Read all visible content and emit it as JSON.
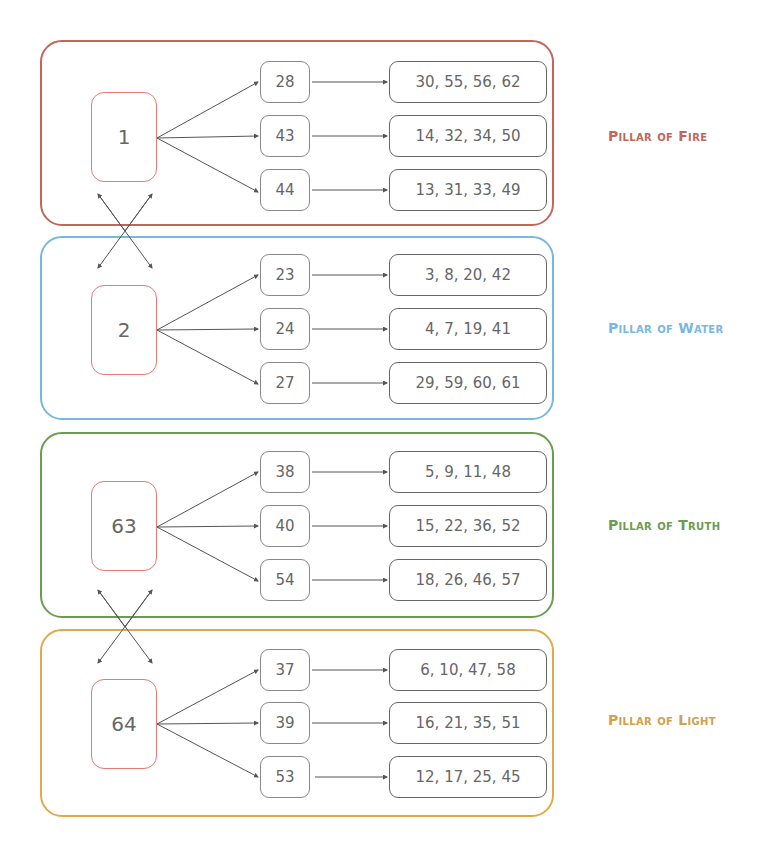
{
  "colors": {
    "fire": "#c0675a",
    "water": "#7ab7de",
    "truth": "#6a9d4f",
    "light": "#e2a94a",
    "root_border": "#e47a72",
    "edge": "#555555"
  },
  "pillars": [
    {
      "label": "Pillar of Fire",
      "root": "1",
      "children": [
        {
          "node": "28",
          "leaf": "30, 55, 56, 62"
        },
        {
          "node": "43",
          "leaf": "14, 32, 34, 50"
        },
        {
          "node": "44",
          "leaf": "13, 31, 33, 49"
        }
      ]
    },
    {
      "label": "Pillar of Water",
      "root": "2",
      "children": [
        {
          "node": "23",
          "leaf": "3, 8, 20, 42"
        },
        {
          "node": "24",
          "leaf": "4, 7, 19, 41"
        },
        {
          "node": "27",
          "leaf": "29, 59, 60, 61"
        }
      ]
    },
    {
      "label": "Pillar of Truth",
      "root": "63",
      "children": [
        {
          "node": "38",
          "leaf": "5, 9, 11, 48"
        },
        {
          "node": "40",
          "leaf": "15, 22, 36, 52"
        },
        {
          "node": "54",
          "leaf": "18, 26, 46, 57"
        }
      ]
    },
    {
      "label": "Pillar of Light",
      "root": "64",
      "children": [
        {
          "node": "37",
          "leaf": "6, 10, 47, 58"
        },
        {
          "node": "39",
          "leaf": "16, 21, 35, 51"
        },
        {
          "node": "53",
          "leaf": "12, 17, 25, 45"
        }
      ]
    }
  ],
  "cross_links": [
    {
      "between": [
        "1",
        "2"
      ]
    },
    {
      "between": [
        "63",
        "64"
      ]
    }
  ]
}
